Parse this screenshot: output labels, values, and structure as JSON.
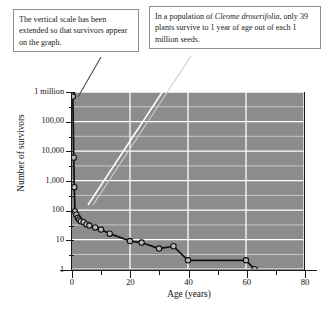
{
  "annotations": {
    "left": {
      "name": "vertical-scale-note",
      "text": "The vertical scale has been extended so that survivors appear on the graph."
    },
    "right": {
      "name": "survivorship-note",
      "prefix": "In a population of ",
      "species": "Cleome droserifolia",
      "suffix": ", only 39 plants survive to 1 year of age out of each 1 million seeds."
    }
  },
  "colors": {
    "plot_background": "#8c8c8c",
    "gridline": "#ffffff",
    "axis": "#1b1b1b",
    "curve": "#101010",
    "marker_fill": "#b9b9b9",
    "page_background": "#ffffff",
    "callout_border": "#8e8e8e"
  },
  "chart_data": {
    "type": "line",
    "title": "",
    "xlabel": "Age (years)",
    "ylabel": "Number of survivors",
    "xlim": [
      0,
      80
    ],
    "ylim": [
      1,
      1000000
    ],
    "yscale": "log",
    "grid": true,
    "legend": "none",
    "xticks": [
      0,
      20,
      40,
      60,
      80
    ],
    "xticklabels": [
      "0",
      "20",
      "40",
      "60",
      "80"
    ],
    "xminorticks": [
      10,
      30,
      50,
      70
    ],
    "yticks": [
      1,
      10,
      100,
      1000,
      10000,
      100000,
      1000000
    ],
    "yticklabels": [
      "1",
      "10",
      "100",
      "1,000",
      "10,000",
      "100,00",
      "1 million"
    ],
    "yminorticks": [
      3.16,
      31.6,
      316,
      3160,
      31600,
      316000
    ],
    "series": [
      {
        "name": "survivors",
        "marker": "open-circle",
        "x": [
          0,
          0.3,
          0.6,
          0.8,
          1.0,
          1.5,
          2.0,
          2.5,
          3.0,
          4.0,
          5.0,
          6.0,
          8.0,
          10.0,
          13.0,
          20.0,
          24.0,
          30.0,
          35.0,
          40.0,
          60.0,
          63.0
        ],
        "y": [
          1000000,
          700000,
          6000,
          600,
          90,
          70,
          55,
          48,
          42,
          39,
          33,
          30,
          26,
          22,
          16,
          9,
          8,
          5,
          6,
          2,
          2,
          1
        ]
      }
    ],
    "callouts": [
      {
        "text": "The vertical scale has been extended so that survivors appear on the graph.",
        "points_to": {
          "x": 0,
          "y": 1000000
        }
      },
      {
        "text": "In a population of Cleome droserifolia, only 39 plants survive to 1 year of age out of each 1 million seeds.",
        "points_to": {
          "x": 4,
          "y": 39
        }
      }
    ]
  }
}
